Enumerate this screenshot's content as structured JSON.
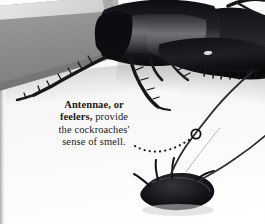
{
  "figure": {
    "kind": "photographic-figure",
    "color_mode": "black-and-white",
    "background_color": "#ffffff"
  },
  "caption": {
    "bold_lead": "Antennae, or feelers,",
    "line_1_bold": "Antennae, or",
    "line_2_bold": "feelers,",
    "line_2_rest": " provide",
    "line_3": "the cockroaches'",
    "line_4": "sense of smell.",
    "full_text": "Antennae, or feelers, provide the cockroaches' sense of smell.",
    "text_color": "#1a1a1a"
  },
  "callout": {
    "marker_shape": "circle-outline",
    "marker_color": "#121212",
    "marker_x": 196,
    "marker_y": 134,
    "marker_radius": 4.6,
    "leader_style": "dotted-curve",
    "leader_color": "#1d1d1d"
  },
  "elements": {
    "slab_label": "grey angled slab",
    "slab_color": "#8d8d8d",
    "slab_highlight_color": "#d7d7d7",
    "upper_specimen_label": "large cockroach body, lateral view",
    "lower_specimen_label": "cockroach head with antennae",
    "specimen_color": "#15161a",
    "antenna_color": "#2a2b2f",
    "page_gutter_label": "page gutter shadow"
  }
}
